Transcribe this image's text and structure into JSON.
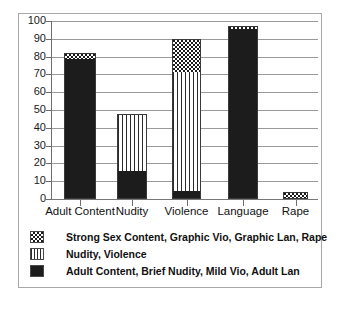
{
  "chart_data": {
    "type": "bar",
    "subtype": "stacked-bar",
    "title": "",
    "xlabel": "",
    "ylabel": "",
    "ylim": [
      0,
      100
    ],
    "ytick_step": 10,
    "yticks": [
      100,
      90,
      80,
      70,
      60,
      50,
      40,
      30,
      20,
      10,
      0
    ],
    "grid": true,
    "grid_axis": "y",
    "legend_position": "below-plot",
    "categories": [
      "Adult Content",
      "Nudity",
      "Violence",
      "Language",
      "Rape"
    ],
    "series": [
      {
        "name": "Adult Content, Brief Nudity, Mild Vio, Adult Lan",
        "pattern": "solid",
        "values": [
          78,
          15,
          4,
          95,
          0
        ]
      },
      {
        "name": "Nudity, Violence",
        "pattern": "stripes",
        "values": [
          0,
          33,
          67,
          0,
          0
        ]
      },
      {
        "name": "Strong Sex Content, Graphic Vio, Graphic Lan, Rape",
        "pattern": "check",
        "values": [
          4,
          0,
          19,
          2,
          4
        ]
      }
    ],
    "totals": [
      82,
      48,
      90,
      97,
      4
    ],
    "legend": [
      {
        "pattern": "check",
        "label": "Strong Sex Content, Graphic Vio, Graphic Lan, Rape"
      },
      {
        "pattern": "stripes",
        "label": "Nudity, Violence"
      },
      {
        "pattern": "solid",
        "label": "Adult Content, Brief Nudity, Mild Vio, Adult Lan"
      }
    ],
    "colors": {
      "solid": "#1c1c1c",
      "stripes": "#2b2b2b",
      "check": "#1c1c1c",
      "grid": "#9a9a9a",
      "axis": "#6f6f6f",
      "frame": "#a8a8a8",
      "background": "#ffffff",
      "text": "#121212"
    }
  }
}
